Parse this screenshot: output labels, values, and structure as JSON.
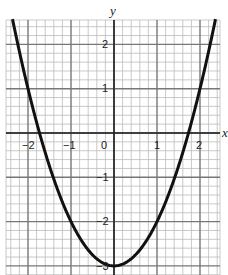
{
  "chart_data": {
    "type": "line",
    "title": "",
    "xlabel": "x",
    "ylabel": "y",
    "xlim": [
      -2.5,
      2.5
    ],
    "ylim": [
      -3.1,
      2.6
    ],
    "grid": true,
    "minor_grid_step": 0.2,
    "x_ticks": [
      -2,
      -1,
      0,
      1,
      2
    ],
    "x_tick_labels": [
      "−2",
      "−1",
      "0",
      "1",
      "2"
    ],
    "y_ticks": [
      2,
      1,
      -1,
      -2,
      -3
    ],
    "y_tick_labels": [
      "2",
      "1",
      "−1",
      "−2",
      "−3"
    ],
    "series": [
      {
        "name": "y = x² − 3",
        "equation": "y = x^2 - 3",
        "x": [
          -2.36,
          -2,
          -1.732,
          -1.5,
          -1,
          -0.5,
          0,
          0.5,
          1,
          1.5,
          1.732,
          2,
          2.36
        ],
        "values": [
          2.57,
          1,
          0,
          -0.75,
          -2,
          -2.75,
          -3,
          -2.75,
          -2,
          -0.75,
          0,
          1,
          2.57
        ]
      }
    ],
    "colors": {
      "curve": "#111111",
      "major_grid": "#777777",
      "minor_grid": "#bbbbbb",
      "axis": "#222222"
    }
  },
  "labels": {
    "x_axis": "x",
    "y_axis": "y",
    "xt_m2": "−2",
    "xt_m1": "−1",
    "xt_0": "0",
    "xt_1": "1",
    "xt_2": "2",
    "yt_2": "2",
    "yt_1": "1",
    "yt_m1": "−1",
    "yt_m2": "−2",
    "yt_m3": "−3"
  }
}
